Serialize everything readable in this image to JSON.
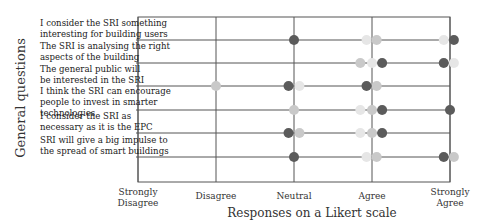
{
  "chart_data": {
    "type": "scatter",
    "title": "",
    "xlabel": "Responses on a Likert scale",
    "ylabel": "General questions",
    "x_ticks": [
      {
        "value": 1,
        "label": [
          "Strongly",
          "Disagree"
        ]
      },
      {
        "value": 2,
        "label": [
          "Disagree"
        ]
      },
      {
        "value": 3,
        "label": [
          "Neutral"
        ]
      },
      {
        "value": 4,
        "label": [
          "Agree"
        ]
      },
      {
        "value": 5,
        "label": [
          "Strongly",
          "Agree"
        ]
      }
    ],
    "xlim": [
      1,
      5
    ],
    "grid": true,
    "legend": null,
    "categories": [
      {
        "lines": [
          "I consider the SRI something",
          "interesting for building users"
        ]
      },
      {
        "lines": [
          "The SRI is analysing the right",
          "aspects of the building"
        ]
      },
      {
        "lines": [
          "The general public will",
          "be interested in the SRI"
        ]
      },
      {
        "lines": [
          "I think the SRI can encourage",
          "people to invest in smarter",
          "technologies"
        ]
      },
      {
        "lines": [
          "I consider the SRI as",
          "necessary as it is the EPC"
        ]
      },
      {
        "lines": [
          "SRI will give a big impulse to",
          "the spread of smart buildings"
        ]
      }
    ],
    "series_colors": {
      "dark": "#5b5b5b",
      "light": "#c9c9c9",
      "verylight": "#e6e6e6"
    },
    "points": [
      {
        "row": 0,
        "x": 3.0,
        "shade": "dark"
      },
      {
        "row": 0,
        "x": 3.93,
        "shade": "verylight"
      },
      {
        "row": 0,
        "x": 4.06,
        "shade": "light"
      },
      {
        "row": 0,
        "x": 4.92,
        "shade": "verylight"
      },
      {
        "row": 0,
        "x": 5.05,
        "shade": "dark"
      },
      {
        "row": 1,
        "x": 3.85,
        "shade": "light"
      },
      {
        "row": 1,
        "x": 4.0,
        "shade": "verylight"
      },
      {
        "row": 1,
        "x": 4.13,
        "shade": "dark"
      },
      {
        "row": 1,
        "x": 4.92,
        "shade": "dark"
      },
      {
        "row": 1,
        "x": 5.05,
        "shade": "verylight"
      },
      {
        "row": 2,
        "x": 2.0,
        "shade": "light"
      },
      {
        "row": 2,
        "x": 2.93,
        "shade": "dark"
      },
      {
        "row": 2,
        "x": 3.07,
        "shade": "verylight"
      },
      {
        "row": 2,
        "x": 3.93,
        "shade": "dark"
      },
      {
        "row": 2,
        "x": 4.06,
        "shade": "light"
      },
      {
        "row": 3,
        "x": 3.0,
        "shade": "light"
      },
      {
        "row": 3,
        "x": 3.85,
        "shade": "verylight"
      },
      {
        "row": 3,
        "x": 4.0,
        "shade": "light"
      },
      {
        "row": 3,
        "x": 4.13,
        "shade": "dark"
      },
      {
        "row": 3,
        "x": 5.0,
        "shade": "dark"
      },
      {
        "row": 4,
        "x": 2.93,
        "shade": "dark"
      },
      {
        "row": 4,
        "x": 3.07,
        "shade": "light"
      },
      {
        "row": 4,
        "x": 3.85,
        "shade": "verylight"
      },
      {
        "row": 4,
        "x": 4.0,
        "shade": "light"
      },
      {
        "row": 4,
        "x": 4.13,
        "shade": "dark"
      },
      {
        "row": 5,
        "x": 3.0,
        "shade": "dark"
      },
      {
        "row": 5,
        "x": 3.93,
        "shade": "verylight"
      },
      {
        "row": 5,
        "x": 4.06,
        "shade": "light"
      },
      {
        "row": 5,
        "x": 4.92,
        "shade": "dark"
      },
      {
        "row": 5,
        "x": 5.05,
        "shade": "light"
      }
    ]
  },
  "layout": {
    "plot_left": 138,
    "plot_right": 450,
    "plot_top": 17,
    "plot_bottom": 182,
    "row_y": [
      40,
      63,
      86,
      110,
      133,
      157
    ],
    "label_right": 136,
    "dot_radius": 5
  }
}
